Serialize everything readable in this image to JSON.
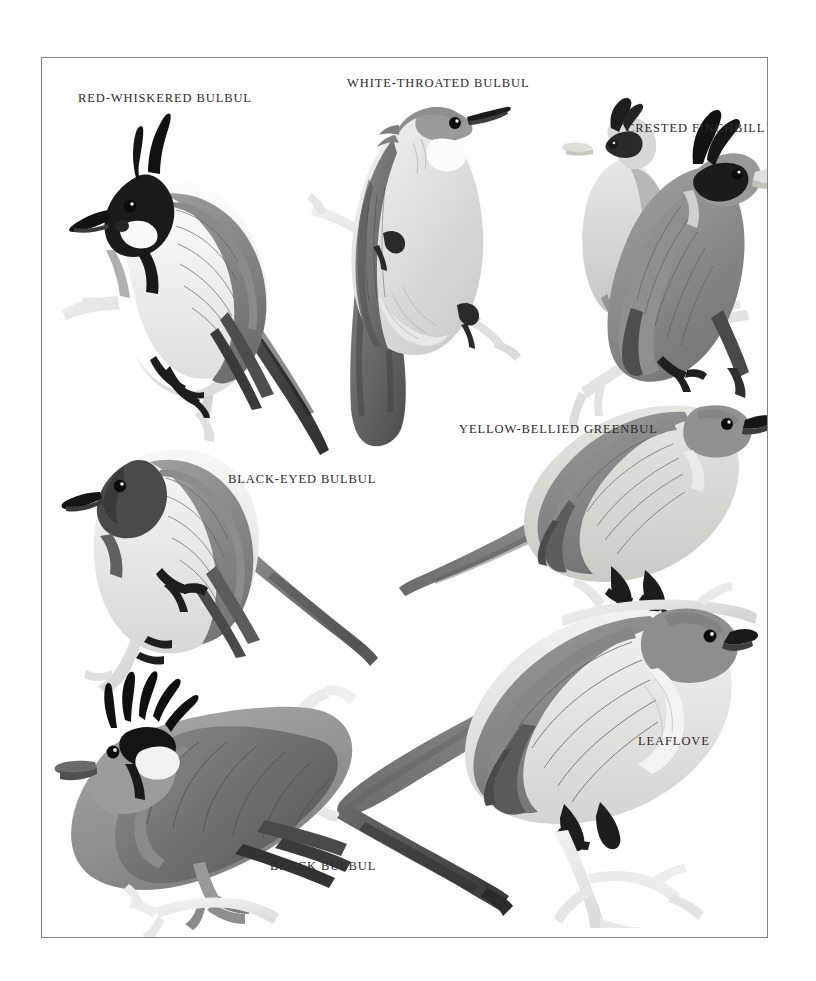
{
  "page": {
    "background_color": "#ffffff",
    "frame": {
      "border_color": "#7e8186",
      "x": 41,
      "y": 57,
      "width": 727,
      "height": 881
    },
    "title": "",
    "style": "grayscale field-guide illustration plate"
  },
  "plate": {
    "caption_text_color": "#2b2b2b",
    "labels": [
      {
        "id": "red-whiskered-bulbul",
        "text": "RED-WHISKERED BULBUL",
        "x": 36,
        "y": 33
      },
      {
        "id": "white-throated-bulbul",
        "text": "WHITE-THROATED BULBUL",
        "x": 305,
        "y": 18
      },
      {
        "id": "crested-finchbill",
        "text": "CRESTED FINCHBILL",
        "x": 584,
        "y": 63
      },
      {
        "id": "yellow-bellied-greenbul",
        "text": "YELLOW-BELLIED GREENBUL",
        "x": 417,
        "y": 364
      },
      {
        "id": "black-eyed-bulbul",
        "text": "BLACK-EYED BULBUL",
        "x": 186,
        "y": 414
      },
      {
        "id": "leaflove",
        "text": "LEAFLOVE",
        "x": 596,
        "y": 676
      },
      {
        "id": "black-bulbul",
        "text": "BLACK BULBUL",
        "x": 228,
        "y": 801
      }
    ],
    "figures": [
      {
        "id": "red-whiskered-bulbul-figure",
        "species": "Red-whiskered Bulbul",
        "description": "Perched bird facing left, tall black pointed crest, black head with white cheek patch and dark malar stripe, grey-brown back and wings, white underparts, long dark tail angled down-right, standing on a pale branch",
        "colors": {
          "crest": "#141414",
          "back": "#8d8d8d",
          "belly": "#f5f5f5",
          "tail": "#3d3d3d",
          "branch": "#dcdcdc"
        }
      },
      {
        "id": "white-throated-bulbul-figure",
        "species": "White-throated Bulbul",
        "description": "Bird clinging upright to a diagonal pale branch, head turned up-right, short crest, white throat, pale cream breast and belly, dark grey-brown wings and long tail hanging downward",
        "colors": {
          "head": "#9a9a9a",
          "breast": "#f0efe9",
          "wing": "#6e6e6e",
          "tail": "#5c5c5c",
          "branch": "#e2e2e2"
        }
      },
      {
        "id": "crested-finchbill-figure",
        "species": "Crested Finchbill",
        "description": "Two birds: a paler rear bird upper-left and a main bird in front facing right, both with forward-curving black crest, black face mask, pale stubby finch-like bill, grey-olive body, dark-tipped tail",
        "colors": {
          "crest": "#151515",
          "face": "#1c1c1c",
          "bill": "#ddd9d2",
          "body": "#949494",
          "tail": "#4a4a4a"
        }
      },
      {
        "id": "black-eyed-bulbul-figure",
        "species": "Black-eyed Bulbul",
        "description": "Bird facing left on a pale upright branch, dark sooty head and throat, grey-brown back and wings, pale whitish-grey belly, long grey tail sloping down to the right",
        "colors": {
          "head": "#4e4e4e",
          "back": "#8f8f8f",
          "belly": "#e9e9e9",
          "tail": "#7b7b7b",
          "branch": "#e4e4e4"
        }
      },
      {
        "id": "yellow-bellied-greenbul-figure",
        "species": "Yellow-bellied Greenbul",
        "description": "Bird facing right perched on a thin horizontal branch, uniform olive-grey upperparts, paler grey-cream underparts, dark bill, long pointed tail extending to the lower left",
        "colors": {
          "upper": "#8b8b8b",
          "under": "#dededa",
          "bill": "#2c2c2c",
          "tail": "#7a7a7a",
          "branch": "#e6e6e6"
        }
      },
      {
        "id": "leaflove-figure",
        "species": "Leaflove",
        "description": "Large bird facing right perched on a pale forked branch, grey-brown head and back, pale whitish throat and breast, broad dark grey wings, long heavy tail extending to the left",
        "colors": {
          "back": "#8a8a8a",
          "throat": "#f0f0ee",
          "wing": "#6f6f6f",
          "tail": "#858585",
          "branch": "#ebebeb"
        }
      },
      {
        "id": "black-bulbul-figure",
        "species": "Black Bulbul",
        "description": "Bird facing left on a pale branch, spiky black crest, white-and-black face pattern, uniform grey body and wings, very long dark grey tail extending to the lower right",
        "colors": {
          "crest": "#101010",
          "face": "#efefef",
          "body": "#9c9c9c",
          "tail": "#6a6a6a",
          "branch": "#ececec"
        }
      }
    ]
  }
}
